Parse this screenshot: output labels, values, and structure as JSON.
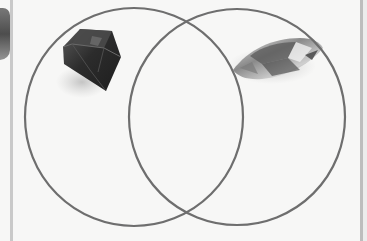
{
  "diagram": {
    "type": "venn",
    "sets": [
      {
        "name": "left-set",
        "image": "dark-cut-gemstone",
        "label": ""
      },
      {
        "name": "right-set",
        "image": "marquise-crystal-gemstone",
        "label": ""
      }
    ],
    "intersection_label": ""
  },
  "colors": {
    "background": "#f7f7f6",
    "circle_stroke": "#6e6e6e",
    "gem_dark": "#2e2e2e",
    "gem_light": "#d8d8d8",
    "edge_line": "#c4c4c4"
  }
}
